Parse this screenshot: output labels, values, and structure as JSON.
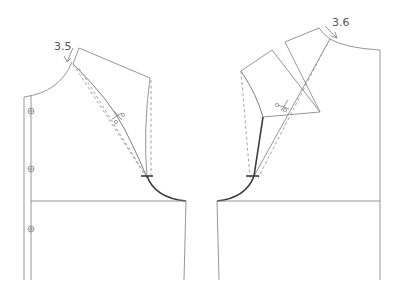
{
  "diagram": {
    "type": "sewing-pattern",
    "left_piece": {
      "measurement_label": "3.5",
      "button_marks": 3,
      "has_scissors_mark": true
    },
    "right_piece": {
      "measurement_label": "3.6",
      "has_scissors_mark": true
    },
    "colors": {
      "outline": "#8a8a8a",
      "dashed": "#9a9a9a",
      "armhole_bold": "#3a3a3a",
      "text": "#555555"
    }
  }
}
